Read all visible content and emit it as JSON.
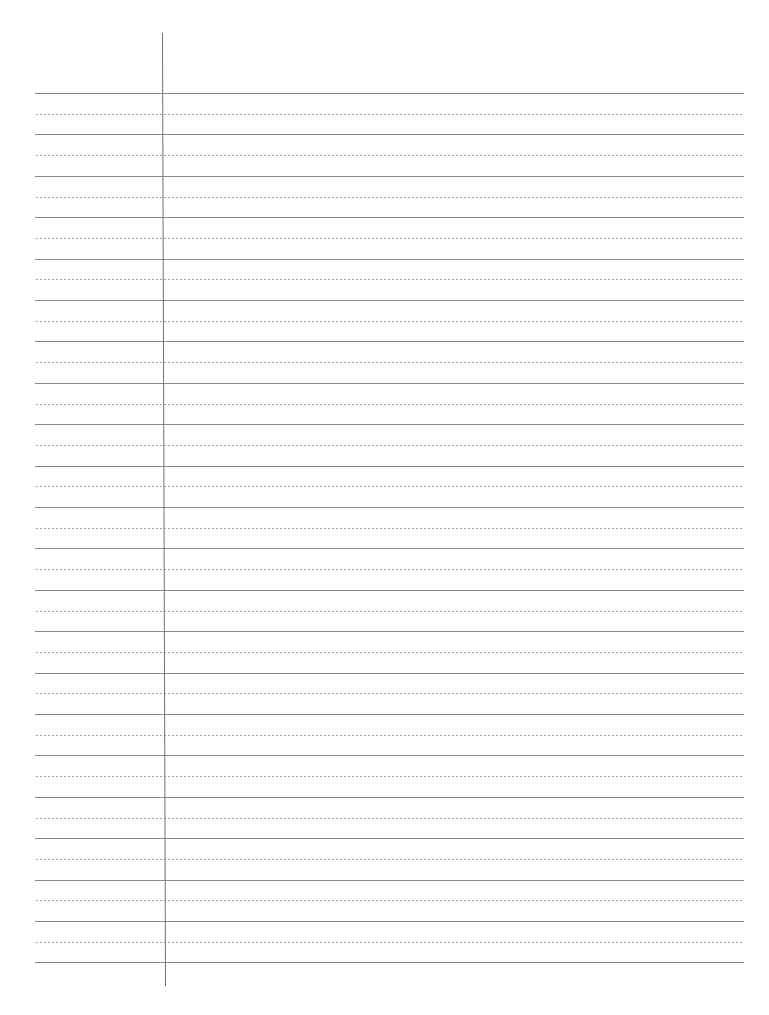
{
  "page": {
    "type": "lined-notebook-paper",
    "background_color": "#ffffff",
    "rule_color": "#8a8a8a",
    "dotted_rule_color": "#a0a0a0",
    "margin_line_color": "#707070",
    "rules": {
      "left": 35,
      "right": 744,
      "first_solid_y": 93,
      "spacing": 41.4,
      "solid_count": 22,
      "dotted_between": true
    },
    "margin_line": {
      "x_top": 162,
      "x_bottom": 165,
      "y_top": 33,
      "y_bottom": 986
    }
  }
}
